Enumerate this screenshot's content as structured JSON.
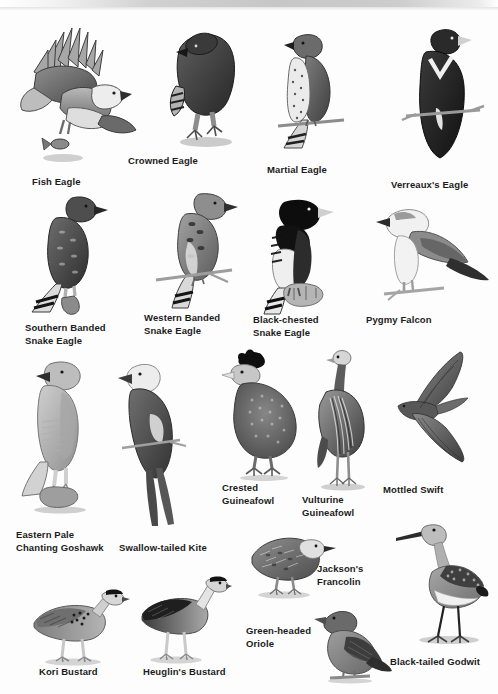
{
  "plate": {
    "title": "African birds of prey and game birds plate",
    "background_color": "#fdfdfd",
    "label_color": "#1b1b1b",
    "ink_color": "#4a4a4a"
  },
  "figures": [
    {
      "id": "fish-eagle",
      "label": "Fish Eagle"
    },
    {
      "id": "crowned-eagle",
      "label": "Crowned Eagle"
    },
    {
      "id": "martial-eagle",
      "label": "Martial Eagle"
    },
    {
      "id": "verreauxs-eagle",
      "label": "Verreaux's Eagle"
    },
    {
      "id": "southern-banded-snake-eagle",
      "label": "Southern Banded\nSnake Eagle"
    },
    {
      "id": "western-banded-snake-eagle",
      "label": "Western Banded\nSnake Eagle"
    },
    {
      "id": "black-chested-snake-eagle",
      "label": "Black-chested\nSnake Eagle"
    },
    {
      "id": "pygmy-falcon",
      "label": "Pygmy Falcon"
    },
    {
      "id": "eastern-pale-chanting-goshawk",
      "label": "Eastern Pale\nChanting Goshawk"
    },
    {
      "id": "swallow-tailed-kite",
      "label": "Swallow-tailed Kite"
    },
    {
      "id": "crested-guineafowl",
      "label": "Crested\nGuineafowl"
    },
    {
      "id": "vulturine-guineafowl",
      "label": "Vulturine\nGuineafowl"
    },
    {
      "id": "mottled-swift",
      "label": "Mottled Swift"
    },
    {
      "id": "jacksons-francolin",
      "label": "Jackson's\nFrancolin"
    },
    {
      "id": "kori-bustard",
      "label": "Kori Bustard"
    },
    {
      "id": "heuglins-bustard",
      "label": "Heuglin's Bustard"
    },
    {
      "id": "green-headed-oriole",
      "label": "Green-headed\nOriole"
    },
    {
      "id": "black-tailed-godwit",
      "label": "Black-tailed Godwit"
    }
  ]
}
